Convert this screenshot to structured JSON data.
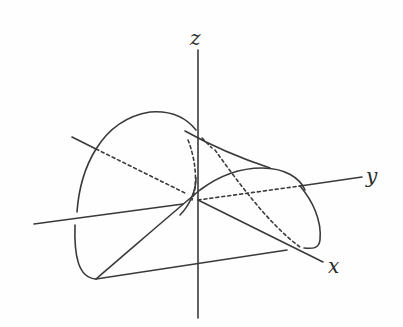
{
  "figure": {
    "axes": {
      "x": {
        "label": "x"
      },
      "y": {
        "label": "y"
      },
      "z": {
        "label": "z"
      }
    },
    "colors": {
      "stroke": "#3a3a3a",
      "background": "#fefefe"
    }
  }
}
